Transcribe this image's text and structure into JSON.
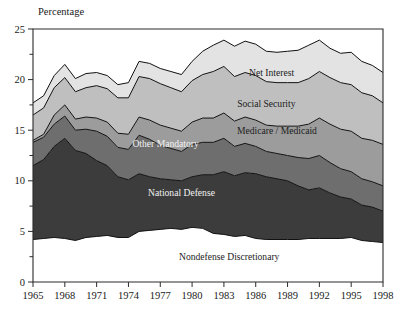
{
  "chart_data": {
    "type": "area",
    "title": "",
    "subtitle": "",
    "ylabel": "Percentage",
    "xlabel": "",
    "ylim": [
      0,
      25
    ],
    "xlim": [
      1965,
      1998
    ],
    "grid": false,
    "legend_position": "inline-labels",
    "stacked": true,
    "y_ticks_major": [
      "0",
      "5",
      "10",
      "15",
      "20",
      "25"
    ],
    "y_tick_values": [
      0,
      5,
      10,
      15,
      20,
      25
    ],
    "y_minor_tick_values": [
      2.5,
      7.5,
      12.5,
      17.5,
      22.5
    ],
    "x_ticks": [
      "1965",
      "1968",
      "1971",
      "1974",
      "1977",
      "1980",
      "1983",
      "1986",
      "1989",
      "1992",
      "1995",
      "1998"
    ],
    "x_tick_values": [
      1965,
      1968,
      1971,
      1974,
      1977,
      1980,
      1983,
      1986,
      1989,
      1992,
      1995,
      1998
    ],
    "x": [
      1965,
      1966,
      1967,
      1968,
      1969,
      1970,
      1971,
      1972,
      1973,
      1974,
      1975,
      1976,
      1977,
      1978,
      1979,
      1980,
      1981,
      1982,
      1983,
      1984,
      1985,
      1986,
      1987,
      1988,
      1989,
      1990,
      1991,
      1992,
      1993,
      1994,
      1995,
      1996,
      1997,
      1998
    ],
    "series": [
      {
        "name": "Nondefense Discretionary",
        "label": "Nondefense Discretionary",
        "color": "#ffffff",
        "label_color": "#1c1c1c",
        "order": 1,
        "values": [
          4.2,
          4.3,
          4.4,
          4.3,
          4.1,
          4.4,
          4.5,
          4.6,
          4.4,
          4.4,
          5.0,
          5.1,
          5.2,
          5.3,
          5.2,
          5.4,
          5.3,
          4.8,
          4.7,
          4.5,
          4.6,
          4.3,
          4.2,
          4.2,
          4.2,
          4.2,
          4.3,
          4.3,
          4.3,
          4.3,
          4.4,
          4.1,
          4.0,
          3.9
        ]
      },
      {
        "name": "National Defense",
        "label": "National Defense",
        "color": "#3c3c3c",
        "label_color": "#f2f2f2",
        "order": 2,
        "values": [
          7.3,
          7.8,
          9.0,
          9.9,
          8.9,
          8.3,
          7.5,
          6.9,
          6.0,
          5.7,
          5.7,
          5.3,
          5.0,
          4.8,
          4.8,
          5.0,
          5.3,
          5.8,
          6.2,
          6.0,
          6.2,
          6.4,
          6.2,
          6.0,
          5.8,
          5.3,
          4.8,
          5.0,
          4.5,
          4.1,
          3.8,
          3.5,
          3.4,
          3.1
        ]
      },
      {
        "name": "Other Mandatory",
        "label": "Other Mandatory",
        "color": "#6e6e6e",
        "label_color": "#f2f2f2",
        "order": 3,
        "values": [
          2.3,
          2.2,
          2.2,
          2.2,
          2.0,
          2.4,
          2.9,
          2.9,
          2.9,
          3.0,
          3.8,
          3.7,
          3.3,
          3.1,
          2.9,
          3.2,
          3.2,
          3.2,
          3.3,
          2.9,
          2.9,
          2.7,
          2.5,
          2.5,
          2.5,
          2.8,
          3.1,
          3.2,
          3.0,
          2.8,
          2.7,
          2.6,
          2.5,
          2.5
        ]
      },
      {
        "name": "Medicare/Medicaid",
        "label": "Medicare / Medicaid",
        "color": "#9c9c9c",
        "label_color": "#1c1c1c",
        "order": 4,
        "values": [
          0.2,
          0.3,
          0.9,
          1.1,
          1.1,
          1.2,
          1.3,
          1.4,
          1.4,
          1.5,
          1.8,
          1.9,
          2.0,
          2.0,
          2.0,
          2.2,
          2.4,
          2.4,
          2.5,
          2.5,
          2.6,
          2.6,
          2.6,
          2.7,
          2.9,
          3.1,
          3.4,
          3.7,
          3.8,
          3.9,
          4.0,
          4.0,
          4.1,
          4.1
        ]
      },
      {
        "name": "Social Security",
        "label": "Social Security",
        "color": "#bfbfbf",
        "label_color": "#1c1c1c",
        "order": 5,
        "values": [
          2.5,
          2.6,
          2.7,
          2.7,
          2.7,
          2.9,
          3.2,
          3.3,
          3.5,
          3.6,
          4.0,
          4.1,
          4.1,
          4.0,
          3.9,
          4.1,
          4.3,
          4.6,
          4.6,
          4.4,
          4.4,
          4.4,
          4.3,
          4.3,
          4.3,
          4.3,
          4.5,
          4.6,
          4.6,
          4.6,
          4.6,
          4.5,
          4.4,
          4.1
        ]
      },
      {
        "name": "Net Interest",
        "label": "Net Interest",
        "color": "#e3e3e3",
        "label_color": "#1c1c1c",
        "order": 6,
        "values": [
          1.2,
          1.2,
          1.2,
          1.3,
          1.3,
          1.4,
          1.3,
          1.3,
          1.3,
          1.5,
          1.5,
          1.5,
          1.5,
          1.6,
          1.7,
          1.9,
          2.3,
          2.6,
          2.6,
          3.0,
          3.1,
          3.1,
          3.0,
          3.0,
          3.1,
          3.2,
          3.3,
          3.1,
          2.9,
          2.9,
          3.2,
          3.1,
          3.0,
          3.0
        ]
      }
    ],
    "totals": [
      17.7,
      18.4,
      20.4,
      21.5,
      20.1,
      20.6,
      20.7,
      20.4,
      19.5,
      19.7,
      21.8,
      21.6,
      21.1,
      20.8,
      20.5,
      21.8,
      22.8,
      23.4,
      23.9,
      23.3,
      23.8,
      23.5,
      22.8,
      22.7,
      22.8,
      22.9,
      23.4,
      23.9,
      23.1,
      22.6,
      22.7,
      21.8,
      21.4,
      20.7
    ],
    "annotations": [
      {
        "text": "Net Interest",
        "x": 1987.5,
        "y": 20.4
      },
      {
        "text": "Social Security",
        "x": 1987.0,
        "y": 17.3
      },
      {
        "text": "Medicare / Medicaid",
        "x": 1988.0,
        "y": 14.6
      },
      {
        "text": "Other Mandatory",
        "x": 1977.5,
        "y": 13.3
      },
      {
        "text": "National Defense",
        "x": 1979.0,
        "y": 8.5
      },
      {
        "text": "Nondefense Discretionary",
        "x": 1983.5,
        "y": 2.2
      }
    ]
  },
  "plot_geometry": {
    "left": 33,
    "right": 383,
    "top": 29,
    "bottom": 282
  },
  "colors": {
    "background": "#ffffff",
    "axis": "#2b2b2b",
    "outline": "#111111",
    "text": "#1a1a1a"
  }
}
